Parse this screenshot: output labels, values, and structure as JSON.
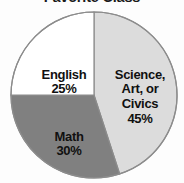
{
  "chart_data": {
    "type": "pie",
    "title": "Favorite Class",
    "xlabel": "",
    "ylabel": "",
    "legend_position": "none",
    "grid": false,
    "units": "percent",
    "start_angle_deg": 0,
    "direction": "clockwise",
    "categories": [
      "Science, Art, or Civics",
      "Math",
      "English"
    ],
    "values": [
      45,
      30,
      25
    ],
    "labels": [
      "Science, Art, or Civics\n45%",
      "Math\n30%",
      "English\n25%"
    ],
    "value_labels": [
      "45%",
      "30%",
      "25%"
    ],
    "colors": [
      "#dcdcdc",
      "#808080",
      "#ffffff"
    ],
    "slices": [
      {
        "name": "Science, Art, or Civics",
        "name_lines": "Science,\nArt, or\nCivics",
        "value": 45,
        "value_label": "45%",
        "color": "#dcdcdc",
        "start_deg": 0,
        "end_deg": 162
      },
      {
        "name": "Math",
        "name_lines": "Math",
        "value": 30,
        "value_label": "30%",
        "color": "#808080",
        "start_deg": 162,
        "end_deg": 270
      },
      {
        "name": "English",
        "name_lines": "English",
        "value": 25,
        "value_label": "25%",
        "color": "#ffffff",
        "start_deg": 270,
        "end_deg": 360
      }
    ]
  },
  "figure": {
    "title": "Favorite Class",
    "outline_color": "#8c8c8c",
    "background": "#fdfdfd",
    "center_x": 94,
    "center_y": 95,
    "radius": 83
  }
}
